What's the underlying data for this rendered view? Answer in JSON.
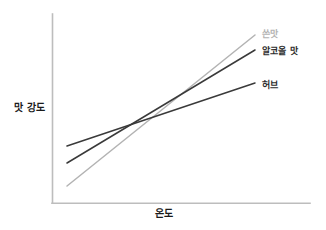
{
  "chart_data": {
    "type": "line",
    "title": "",
    "subtitle": "",
    "xlabel": "온도",
    "ylabel": "맛 강도",
    "xlim": [
      0,
      100
    ],
    "ylim": [
      0,
      100
    ],
    "grid": false,
    "legend_position": "right-inline-end-of-line",
    "axis_ticks": {
      "x": [],
      "y": []
    },
    "annotations": [],
    "series": [
      {
        "name": "쓴맛",
        "color": "#b3b3b3",
        "label_color": "#b3b3b3",
        "x": [
          8,
          100
        ],
        "values": [
          9,
          89
        ],
        "slope": "steepest",
        "points_px": [
          [
            67,
            186
          ],
          [
            255,
            35
          ]
        ]
      },
      {
        "name": "알코올 맛",
        "color": "#3a3a3a",
        "label_color": "#2b2b2b",
        "x": [
          8,
          100
        ],
        "values": [
          21,
          81
        ],
        "slope": "medium",
        "points_px": [
          [
            67,
            163
          ],
          [
            255,
            50
          ]
        ]
      },
      {
        "name": "허브",
        "color": "#3a3a3a",
        "label_color": "#2b2b2b",
        "x": [
          8,
          100
        ],
        "values": [
          30,
          64
        ],
        "slope": "shallowest",
        "points_px": [
          [
            67,
            146
          ],
          [
            255,
            83
          ]
        ]
      }
    ]
  },
  "axes": {
    "y_title": "맛 강도",
    "x_title": "온도",
    "axis_color": "#bdbdbd"
  },
  "legend": {
    "items": [
      {
        "label": "쓴맛"
      },
      {
        "label": "알코올 맛"
      },
      {
        "label": "허브"
      }
    ]
  },
  "colors": {
    "background": "#ffffff",
    "axis": "#bdbdbd",
    "line_dark": "#3a3a3a",
    "line_light": "#b3b3b3",
    "text": "#1a1a1a"
  }
}
